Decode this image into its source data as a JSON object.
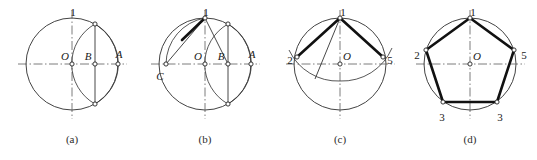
{
  "figure": {
    "background_color": "#ffffff",
    "stroke_color": "#2e2e2e",
    "heavy_stroke_color": "#111111",
    "node_fill_color": "#ffffff",
    "panel_count": 4
  },
  "panels": [
    {
      "id": "a",
      "caption": "(a)",
      "caption_x": 72,
      "caption_y": 143,
      "center": {
        "x": 72,
        "y": 64,
        "label": "O",
        "label_x": 65,
        "label_y": 60
      },
      "radius": 46,
      "labels": [
        {
          "text": "1",
          "x": 73,
          "y": 16,
          "style": "num"
        },
        {
          "text": "O",
          "x": 65,
          "y": 60,
          "style": "pt"
        },
        {
          "text": "B",
          "x": 88,
          "y": 60,
          "style": "pt"
        },
        {
          "text": "A",
          "x": 119,
          "y": 58,
          "style": "pt"
        }
      ],
      "nodes": [
        {
          "name": "center-O",
          "x": 72,
          "y": 64
        },
        {
          "name": "midpoint-B",
          "x": 95,
          "y": 64
        },
        {
          "name": "point-A",
          "x": 118,
          "y": 64
        },
        {
          "name": "arc-top-cross",
          "x": 95,
          "y": 24
        },
        {
          "name": "arc-bottom-cross",
          "x": 95,
          "y": 104
        }
      ],
      "description": "Circle with horizontal and vertical centre lines; arc swung from A locating the midpoint B of radius OA."
    },
    {
      "id": "b",
      "caption": "(b)",
      "caption_x": 205,
      "caption_y": 143,
      "center": {
        "x": 205,
        "y": 64,
        "label": "O",
        "label_x": 198,
        "label_y": 60
      },
      "radius": 46,
      "labels": [
        {
          "text": "1",
          "x": 206,
          "y": 16,
          "style": "num"
        },
        {
          "text": "O",
          "x": 198,
          "y": 60,
          "style": "pt"
        },
        {
          "text": "B",
          "x": 221,
          "y": 60,
          "style": "pt"
        },
        {
          "text": "A",
          "x": 252,
          "y": 58,
          "style": "pt"
        },
        {
          "text": "C",
          "x": 160,
          "y": 80,
          "style": "pt"
        }
      ],
      "nodes": [
        {
          "name": "center-O",
          "x": 205,
          "y": 64
        },
        {
          "name": "midpoint-B",
          "x": 228,
          "y": 64
        },
        {
          "name": "point-A",
          "x": 251,
          "y": 64
        },
        {
          "name": "point-C",
          "x": 166,
          "y": 64
        },
        {
          "name": "top-point-1",
          "x": 205,
          "y": 18
        },
        {
          "name": "arc-top-cross",
          "x": 228,
          "y": 24
        },
        {
          "name": "arc-bottom-cross",
          "x": 228,
          "y": 104
        },
        {
          "name": "arc-chord-mark",
          "x": 182,
          "y": 40
        }
      ],
      "description": "Arc centred on B through top point 1 cuts the horizontal diameter at C; chord C-1 is the pentagon side length."
    },
    {
      "id": "c",
      "caption": "(c)",
      "caption_x": 340,
      "caption_y": 143,
      "center": {
        "x": 340,
        "y": 64,
        "label": "O",
        "label_x": 347,
        "label_y": 60
      },
      "radius": 46,
      "labels": [
        {
          "text": "1",
          "x": 343,
          "y": 16,
          "style": "num"
        },
        {
          "text": "O",
          "x": 347,
          "y": 60,
          "style": "pt"
        },
        {
          "text": "2",
          "x": 290,
          "y": 64,
          "style": "num"
        },
        {
          "text": "5",
          "x": 390,
          "y": 64,
          "style": "num"
        }
      ],
      "nodes": [
        {
          "name": "center-O",
          "x": 340,
          "y": 64
        },
        {
          "name": "vertex-1",
          "x": 340,
          "y": 18
        },
        {
          "name": "vertex-2",
          "x": 297,
          "y": 57
        },
        {
          "name": "vertex-5",
          "x": 383,
          "y": 57
        },
        {
          "name": "arc-mark",
          "x": 315,
          "y": 79
        }
      ],
      "description": "Chord length stepped off from point 1 to locate vertices 2 and 5 on the circle."
    },
    {
      "id": "d",
      "caption": "(d)",
      "caption_x": 470,
      "caption_y": 143,
      "center": {
        "x": 470,
        "y": 64,
        "label": "O",
        "label_x": 477,
        "label_y": 60
      },
      "radius": 46,
      "labels": [
        {
          "text": "1",
          "x": 473,
          "y": 16,
          "style": "num"
        },
        {
          "text": "O",
          "x": 477,
          "y": 60,
          "style": "pt"
        },
        {
          "text": "2",
          "x": 417,
          "y": 59,
          "style": "num"
        },
        {
          "text": "5",
          "x": 524,
          "y": 59,
          "style": "num"
        },
        {
          "text": "3",
          "x": 442,
          "y": 121,
          "style": "num"
        },
        {
          "text": "3",
          "x": 500,
          "y": 121,
          "style": "num"
        }
      ],
      "nodes": [
        {
          "name": "vertex-1",
          "x": 470,
          "y": 18
        },
        {
          "name": "vertex-2-left",
          "x": 426,
          "y": 50
        },
        {
          "name": "vertex-5-right",
          "x": 514,
          "y": 50
        },
        {
          "name": "vertex-3-left",
          "x": 443,
          "y": 102
        },
        {
          "name": "vertex-3-right",
          "x": 497,
          "y": 102
        },
        {
          "name": "center-O",
          "x": 470,
          "y": 64
        }
      ],
      "description": "Completed regular pentagon 1-2-3-3-5 inscribed in the circle."
    }
  ]
}
